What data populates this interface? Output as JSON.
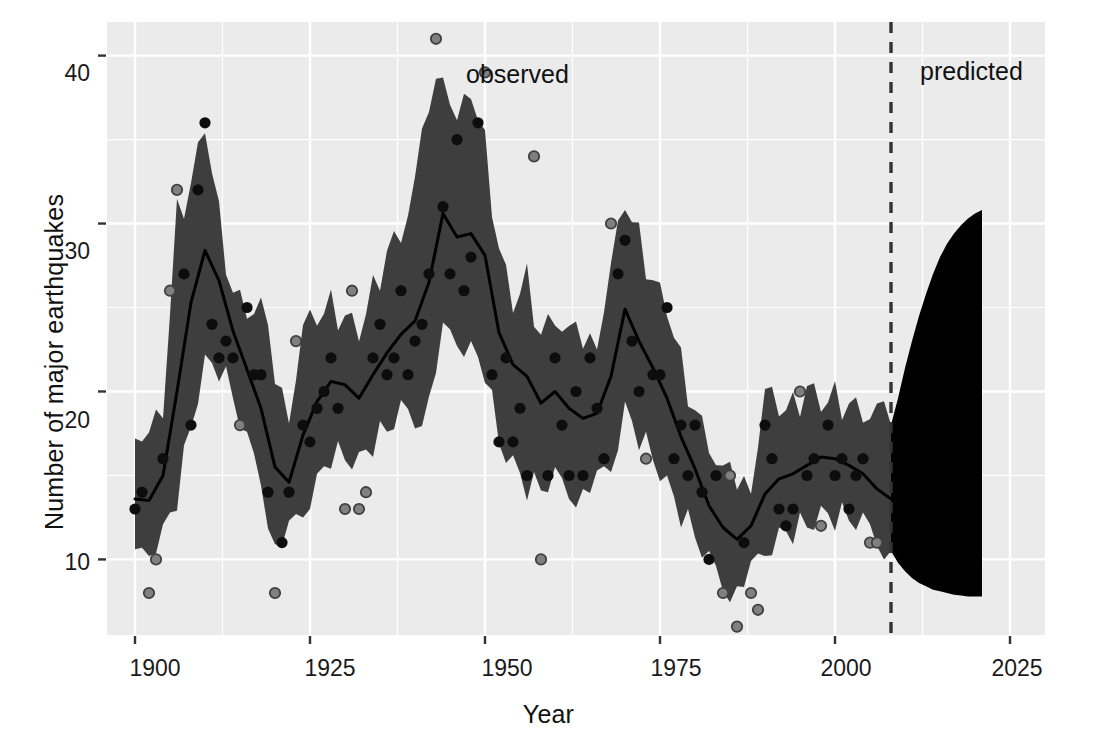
{
  "chart_data": {
    "type": "line",
    "title": "",
    "xlabel": "Year",
    "ylabel": "Number of major earthquakes",
    "xlim": [
      1896,
      2030
    ],
    "ylim": [
      5.5,
      42
    ],
    "xticks": [
      1900,
      1925,
      1950,
      1975,
      2000,
      2025
    ],
    "xticklabels": [
      "1900",
      "1925",
      "1950",
      "1975",
      "2000",
      "2025"
    ],
    "yticks": [
      10,
      20,
      30,
      40
    ],
    "yticklabels": [
      "10",
      "20",
      "30",
      "40"
    ],
    "grid": true,
    "panel_background": "#ebebeb",
    "grid_color": "#ffffff",
    "band_color": "#303030",
    "line_color": "#000000",
    "point_color": "#1a1a1a",
    "observed_point_color": "#808080",
    "observed_point_stroke": "#404040",
    "divider_year": 2008,
    "divider_style": "dashed",
    "annotations": [
      {
        "text": "observed",
        "x": 1941,
        "y": 40.2
      },
      {
        "text": "predicted",
        "x": 2010,
        "y": 40.2
      }
    ],
    "legend": "none",
    "series": [
      {
        "name": "observed counts",
        "type": "scatter",
        "marker": "open-gray-circle",
        "x": [
          1900,
          1901,
          1902,
          1903,
          1904,
          1905,
          1906,
          1907,
          1908,
          1909,
          1910,
          1911,
          1912,
          1913,
          1914,
          1915,
          1916,
          1917,
          1918,
          1919,
          1920,
          1921,
          1922,
          1923,
          1924,
          1925,
          1926,
          1927,
          1928,
          1929,
          1930,
          1931,
          1932,
          1933,
          1934,
          1935,
          1936,
          1937,
          1938,
          1939,
          1940,
          1941,
          1942,
          1943,
          1944,
          1945,
          1946,
          1947,
          1948,
          1949,
          1950,
          1951,
          1952,
          1953,
          1954,
          1955,
          1956,
          1957,
          1958,
          1959,
          1960,
          1961,
          1962,
          1963,
          1964,
          1965,
          1966,
          1967,
          1968,
          1969,
          1970,
          1971,
          1972,
          1973,
          1974,
          1975,
          1976,
          1977,
          1978,
          1979,
          1980,
          1981,
          1982,
          1983,
          1984,
          1985,
          1986,
          1987,
          1988,
          1989,
          1990,
          1991,
          1992,
          1993,
          1994,
          1995,
          1996,
          1997,
          1998,
          1999,
          2000,
          2001,
          2002,
          2003,
          2004,
          2005,
          2006
        ],
        "y": [
          13,
          14,
          8,
          10,
          16,
          26,
          32,
          27,
          18,
          32,
          36,
          24,
          22,
          23,
          22,
          18,
          25,
          21,
          21,
          14,
          8,
          11,
          14,
          23,
          18,
          17,
          19,
          20,
          22,
          19,
          13,
          26,
          13,
          14,
          22,
          24,
          21,
          22,
          26,
          21,
          23,
          24,
          27,
          41,
          31,
          27,
          35,
          26,
          28,
          36,
          39,
          21,
          17,
          22,
          17,
          19,
          15,
          34,
          10,
          15,
          22,
          18,
          15,
          20,
          15,
          22,
          19,
          16,
          30,
          27,
          29,
          23,
          20,
          16,
          21,
          21,
          25,
          16,
          18,
          15,
          18,
          14,
          10,
          15,
          8,
          15,
          6,
          11,
          8,
          7,
          18,
          16,
          13,
          12,
          13,
          20,
          15,
          16,
          12,
          18,
          15,
          16,
          13,
          15,
          16,
          11,
          11
        ]
      },
      {
        "name": "fitted mean",
        "type": "line",
        "x": [
          1900,
          1902,
          1904,
          1906,
          1908,
          1910,
          1912,
          1914,
          1916,
          1918,
          1920,
          1922,
          1924,
          1926,
          1928,
          1930,
          1932,
          1934,
          1936,
          1938,
          1940,
          1942,
          1944,
          1946,
          1948,
          1950,
          1952,
          1954,
          1956,
          1958,
          1960,
          1962,
          1964,
          1966,
          1968,
          1970,
          1972,
          1974,
          1976,
          1978,
          1980,
          1982,
          1984,
          1986,
          1988,
          1990,
          1992,
          1994,
          1996,
          1998,
          2000,
          2002,
          2004,
          2006,
          2008
        ],
        "y": [
          13.6,
          13.5,
          15.0,
          20.0,
          25.3,
          28.4,
          26.6,
          23.6,
          21.3,
          19.0,
          15.5,
          14.6,
          17.4,
          19.4,
          20.6,
          20.4,
          19.6,
          21.0,
          22.3,
          23.4,
          24.2,
          26.5,
          30.6,
          29.2,
          29.4,
          28.1,
          23.5,
          21.6,
          20.9,
          19.3,
          20.0,
          19.0,
          18.4,
          18.7,
          20.9,
          24.9,
          23.0,
          21.4,
          19.6,
          17.3,
          15.4,
          13.2,
          11.9,
          11.2,
          12.0,
          13.9,
          14.8,
          15.1,
          15.6,
          16.1,
          16.0,
          15.6,
          15.1,
          14.2,
          13.6
        ]
      },
      {
        "name": "observed uncertainty band",
        "type": "band",
        "x": [
          1900,
          1902,
          1904,
          1906,
          1908,
          1910,
          1912,
          1914,
          1916,
          1918,
          1920,
          1922,
          1924,
          1926,
          1928,
          1930,
          1932,
          1934,
          1936,
          1938,
          1940,
          1942,
          1944,
          1946,
          1948,
          1950,
          1952,
          1954,
          1956,
          1958,
          1960,
          1962,
          1964,
          1966,
          1968,
          1970,
          1972,
          1974,
          1976,
          1978,
          1980,
          1982,
          1984,
          1986,
          1988,
          1990,
          1992,
          1994,
          1996,
          1998,
          2000,
          2002,
          2004,
          2006,
          2008
        ],
        "upper": [
          18.5,
          17.2,
          19.0,
          30.4,
          32.3,
          36.2,
          30.5,
          26.0,
          25.4,
          25.0,
          20.8,
          19.4,
          23.6,
          24.5,
          25.0,
          24.4,
          23.8,
          26.1,
          28.5,
          29.9,
          32.2,
          37.0,
          40.0,
          35.8,
          38.0,
          34.5,
          28.4,
          25.5,
          26.8,
          23.5,
          25.0,
          23.3,
          22.9,
          23.8,
          27.3,
          31.4,
          29.0,
          26.5,
          25.3,
          21.8,
          19.0,
          17.4,
          15.0,
          14.5,
          15.2,
          19.8,
          19.1,
          18.9,
          20.2,
          19.6,
          19.8,
          19.4,
          19.2,
          18.7,
          18.0
        ],
        "lower": [
          9.5,
          10.5,
          11.6,
          13.8,
          18.0,
          21.5,
          21.3,
          19.5,
          16.7,
          14.9,
          10.6,
          11.2,
          12.8,
          14.6,
          16.3,
          16.0,
          15.7,
          16.8,
          17.5,
          18.6,
          18.3,
          19.4,
          23.0,
          23.0,
          22.5,
          21.4,
          17.0,
          15.5,
          14.2,
          14.0,
          14.6,
          14.1,
          13.9,
          14.2,
          15.5,
          18.9,
          17.4,
          16.0,
          14.3,
          12.6,
          11.2,
          9.6,
          8.6,
          8.1,
          8.8,
          10.5,
          11.4,
          11.8,
          12.0,
          12.5,
          12.4,
          12.2,
          11.9,
          11.3,
          10.5
        ]
      },
      {
        "name": "predicted fan",
        "type": "band",
        "x": [
          2008,
          2009,
          2010,
          2011,
          2012,
          2013,
          2014,
          2015,
          2016,
          2017,
          2018,
          2019,
          2020,
          2021
        ],
        "upper": [
          18.0,
          19.6,
          21.4,
          23.0,
          24.5,
          25.8,
          27.0,
          28.0,
          28.8,
          29.4,
          29.9,
          30.3,
          30.6,
          30.8
        ],
        "lower": [
          10.5,
          9.8,
          9.3,
          8.9,
          8.6,
          8.4,
          8.2,
          8.1,
          8.0,
          7.9,
          7.85,
          7.8,
          7.8,
          7.8
        ]
      }
    ]
  },
  "axes": {
    "xlabel": "Year",
    "ylabel": "Number of major earthquakes"
  },
  "annotations": {
    "observed": "observed",
    "predicted": "predicted"
  },
  "ticks": {
    "x": [
      "1900",
      "1925",
      "1950",
      "1975",
      "2000",
      "2025"
    ],
    "y": [
      "40",
      "30",
      "20",
      "10"
    ]
  }
}
